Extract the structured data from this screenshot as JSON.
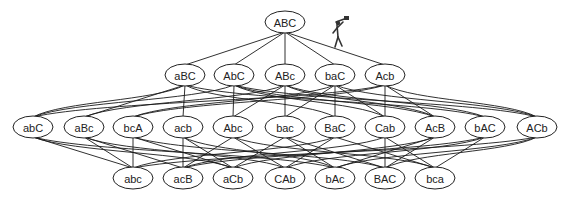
{
  "diagram": {
    "type": "lattice",
    "levels": [
      {
        "y": 22,
        "nodes": [
          {
            "id": "ABC",
            "label": "ABC",
            "x": 285
          }
        ]
      },
      {
        "y": 75,
        "nodes": [
          {
            "id": "aBC",
            "label": "aBC",
            "x": 185
          },
          {
            "id": "AbC",
            "label": "AbC",
            "x": 234
          },
          {
            "id": "ABc",
            "label": "ABc",
            "x": 285
          },
          {
            "id": "baC",
            "label": "baC",
            "x": 335
          },
          {
            "id": "Acb",
            "label": "Acb",
            "x": 385
          }
        ]
      },
      {
        "y": 127,
        "nodes": [
          {
            "id": "abC",
            "label": "abC",
            "x": 33
          },
          {
            "id": "aBc",
            "label": "aBc",
            "x": 84
          },
          {
            "id": "bcA",
            "label": "bcA",
            "x": 133
          },
          {
            "id": "acb",
            "label": "acb",
            "x": 183
          },
          {
            "id": "Abc",
            "label": "Abc",
            "x": 233
          },
          {
            "id": "bac",
            "label": "bac",
            "x": 285
          },
          {
            "id": "BaC",
            "label": "BaC",
            "x": 335
          },
          {
            "id": "Cab",
            "label": "Cab",
            "x": 385
          },
          {
            "id": "AcB",
            "label": "AcB",
            "x": 435
          },
          {
            "id": "bAC",
            "label": "bAC",
            "x": 485
          },
          {
            "id": "ACb",
            "label": "ACb",
            "x": 537
          }
        ]
      },
      {
        "y": 178,
        "nodes": [
          {
            "id": "abc",
            "label": "abc",
            "x": 133
          },
          {
            "id": "acB",
            "label": "acB",
            "x": 183
          },
          {
            "id": "aCb",
            "label": "aCb",
            "x": 233
          },
          {
            "id": "CAb",
            "label": "CAb",
            "x": 285
          },
          {
            "id": "bAc",
            "label": "bAc",
            "x": 335
          },
          {
            "id": "BAC",
            "label": "BAC",
            "x": 385
          },
          {
            "id": "bca",
            "label": "bca",
            "x": 435
          }
        ]
      }
    ],
    "edges": [
      [
        "ABC",
        "aBC"
      ],
      [
        "ABC",
        "AbC"
      ],
      [
        "ABC",
        "ABc"
      ],
      [
        "ABC",
        "baC"
      ],
      [
        "ABC",
        "Acb"
      ],
      [
        "aBC",
        "abC"
      ],
      [
        "aBC",
        "aBc"
      ],
      [
        "aBC",
        "acb"
      ],
      [
        "aBC",
        "BaC"
      ],
      [
        "aBC",
        "bAC"
      ],
      [
        "AbC",
        "abC"
      ],
      [
        "AbC",
        "Abc"
      ],
      [
        "AbC",
        "Cab"
      ],
      [
        "AbC",
        "AcB"
      ],
      [
        "AbC",
        "ACb"
      ],
      [
        "ABc",
        "aBc"
      ],
      [
        "ABc",
        "Abc"
      ],
      [
        "ABc",
        "bac"
      ],
      [
        "ABc",
        "AcB"
      ],
      [
        "ABc",
        "bAC"
      ],
      [
        "baC",
        "bcA"
      ],
      [
        "baC",
        "bac"
      ],
      [
        "baC",
        "BaC"
      ],
      [
        "baC",
        "Cab"
      ],
      [
        "baC",
        "ACb"
      ],
      [
        "Acb",
        "abC"
      ],
      [
        "Acb",
        "bcA"
      ],
      [
        "Acb",
        "Cab"
      ],
      [
        "Acb",
        "AcB"
      ],
      [
        "Acb",
        "ACb"
      ],
      [
        "abC",
        "abc"
      ],
      [
        "abC",
        "aCb"
      ],
      [
        "abC",
        "bAc"
      ],
      [
        "aBc",
        "abc"
      ],
      [
        "aBc",
        "acB"
      ],
      [
        "aBc",
        "CAb"
      ],
      [
        "bcA",
        "abc"
      ],
      [
        "bcA",
        "aCb"
      ],
      [
        "bcA",
        "BAC"
      ],
      [
        "acb",
        "acB"
      ],
      [
        "acb",
        "aCb"
      ],
      [
        "acb",
        "bAc"
      ],
      [
        "Abc",
        "acB"
      ],
      [
        "Abc",
        "CAb"
      ],
      [
        "Abc",
        "bca"
      ],
      [
        "bac",
        "aCb"
      ],
      [
        "bac",
        "bAc"
      ],
      [
        "bac",
        "BAC"
      ],
      [
        "BaC",
        "abc"
      ],
      [
        "BaC",
        "CAb"
      ],
      [
        "BaC",
        "bca"
      ],
      [
        "Cab",
        "acB"
      ],
      [
        "Cab",
        "BAC"
      ],
      [
        "Cab",
        "bca"
      ],
      [
        "AcB",
        "aCb"
      ],
      [
        "AcB",
        "bAc"
      ],
      [
        "AcB",
        "BAC"
      ],
      [
        "bAC",
        "acB"
      ],
      [
        "bAC",
        "CAb"
      ],
      [
        "bAC",
        "bca"
      ],
      [
        "ACb",
        "abc"
      ],
      [
        "ACb",
        "bAc"
      ],
      [
        "ACb",
        "BAC"
      ]
    ],
    "figure": {
      "name": "stick-figure-with-telescope",
      "x": 338,
      "y": 18
    }
  }
}
